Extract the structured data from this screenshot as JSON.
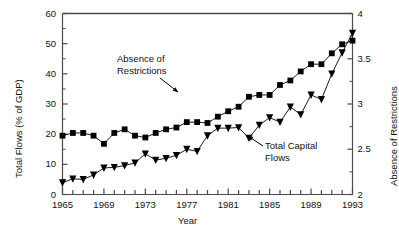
{
  "chart_data": {
    "type": "line",
    "title": "",
    "xlabel": "Year",
    "ylabel": "Total Flows (% of GDP)",
    "ylabel_right": "Absence of Restrictions",
    "xlim": [
      1965,
      1993
    ],
    "ylim": [
      0,
      60
    ],
    "ylim_right": [
      2,
      4
    ],
    "ytick_labels": [
      "0",
      "10",
      "20",
      "30",
      "40",
      "50",
      "60"
    ],
    "ytick_values": [
      0,
      10,
      20,
      30,
      40,
      50,
      60
    ],
    "ytick_right_labels": [
      "2",
      "2.5",
      "3",
      "3.5",
      "4"
    ],
    "ytick_right_values": [
      2,
      2.5,
      3,
      3.5,
      4
    ],
    "xtick_labels": [
      "1965",
      "1969",
      "1973",
      "1977",
      "1981",
      "1985",
      "1989",
      "1993"
    ],
    "xtick_values": [
      1965,
      1969,
      1973,
      1977,
      1981,
      1985,
      1989,
      1993
    ],
    "xtick_minor_step": 1,
    "grid": false,
    "legend_position": "annotations",
    "x": [
      1965,
      1966,
      1967,
      1968,
      1969,
      1970,
      1971,
      1972,
      1973,
      1974,
      1975,
      1976,
      1977,
      1978,
      1979,
      1980,
      1981,
      1982,
      1983,
      1984,
      1985,
      1986,
      1987,
      1988,
      1989,
      1990,
      1991,
      1992,
      1993
    ],
    "series": [
      {
        "name": "Absence of Restrictions",
        "axis": "right",
        "marker": "square",
        "values": [
          2.65,
          2.68,
          2.68,
          2.65,
          2.56,
          2.68,
          2.72,
          2.65,
          2.63,
          2.68,
          2.72,
          2.74,
          2.8,
          2.8,
          2.79,
          2.86,
          2.92,
          2.97,
          3.08,
          3.1,
          3.1,
          3.21,
          3.26,
          3.36,
          3.44,
          3.44,
          3.56,
          3.66,
          3.7
        ],
        "values_left_equivalent": [
          19.5,
          20.4,
          20.4,
          19.4,
          16.9,
          20.4,
          21.5,
          19.6,
          18.9,
          20.4,
          21.7,
          22.2,
          23.9,
          24.1,
          23.6,
          25.8,
          27.6,
          29.2,
          32.3,
          33.0,
          32.9,
          36.4,
          37.9,
          40.7,
          43.1,
          43.2,
          46.8,
          49.9,
          51.0
        ]
      },
      {
        "name": "Total Capital Flows",
        "axis": "left",
        "marker": "triangle-down",
        "values": [
          3.9,
          5.2,
          5.0,
          6.5,
          8.8,
          9.0,
          9.6,
          10.5,
          13.5,
          11.4,
          12.0,
          13.0,
          15.0,
          14.3,
          19.5,
          22.0,
          22.0,
          22.2,
          18.7,
          23.0,
          25.5,
          24.0,
          29.0,
          26.5,
          33.0,
          31.5,
          40.0,
          47.0,
          53.5
        ]
      }
    ],
    "annotations": [
      {
        "text_line1": "Absence of",
        "text_line2": "Restrictions",
        "target_series": "Absence of Restrictions"
      },
      {
        "text_line1": "Total Capital",
        "text_line2": "Flows",
        "target_series": "Total Capital Flows"
      }
    ]
  }
}
